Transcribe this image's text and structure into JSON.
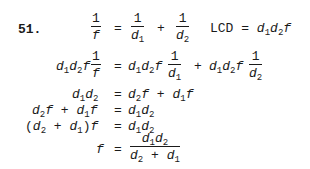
{
  "problem_number": "51.",
  "lines": [
    {
      "lhs": "1/f",
      "rhs": "1/d1 + 1/d2",
      "note": "LCD = d1d2f"
    },
    {
      "lhs": "d1d2f · 1/f",
      "rhs": "d1d2f · 1/d1 + d1d2f · 1/d2"
    },
    {
      "lhs": "d1d2",
      "rhs": "d2f + d1f"
    },
    {
      "lhs": "d2f + d1f",
      "rhs": "d1d2"
    },
    {
      "lhs": "(d2 + d1)f",
      "rhs": "d1d2"
    },
    {
      "lhs": "f",
      "rhs": "d1d2 / (d2 + d1)"
    }
  ],
  "sym": {
    "eq": "=",
    "plus": "+",
    "one": "1",
    "d": "d",
    "f": "f",
    "s1": "1",
    "s2": "2",
    "lcd": "LCD",
    "lp": "(",
    "rp": ")"
  }
}
